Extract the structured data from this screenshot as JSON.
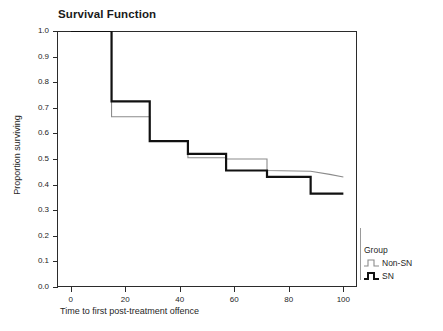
{
  "chart_data": {
    "type": "line",
    "title": "Survival Function",
    "xlabel": "Time to first post-treatment offence",
    "ylabel": "Proportion surviving",
    "xlim": [
      -5,
      105
    ],
    "ylim": [
      0.0,
      1.0
    ],
    "grid": false,
    "legend_position": "right",
    "legend_title": "Group",
    "xticks": [
      0,
      20,
      40,
      60,
      80,
      100
    ],
    "xtick_labels": [
      "0",
      "20",
      "40",
      "60",
      "80",
      "100"
    ],
    "yticks": [
      0.0,
      0.1,
      0.2,
      0.3,
      0.4,
      0.5,
      0.6,
      0.7,
      0.8,
      0.9,
      1.0
    ],
    "ytick_labels": [
      "0.0",
      "0.1",
      "0.2",
      "0.3",
      "0.4",
      "0.5",
      "0.6",
      "0.7",
      "0.8",
      "0.9",
      "1.0"
    ],
    "series": [
      {
        "name": "Non-SN",
        "color": "#8c8c8c",
        "linewidth": 1,
        "style": "step-post",
        "x": [
          0,
          15,
          15,
          29,
          29,
          43,
          43,
          57,
          57,
          72,
          72,
          88,
          95,
          100
        ],
        "y": [
          1.0,
          1.0,
          0.665,
          0.665,
          0.57,
          0.57,
          0.505,
          0.505,
          0.5,
          0.5,
          0.455,
          0.452,
          0.44,
          0.43
        ]
      },
      {
        "name": "SN",
        "color": "#111111",
        "linewidth": 2,
        "style": "step-post",
        "x": [
          0,
          15,
          15,
          29,
          29,
          43,
          43,
          57,
          57,
          72,
          72,
          88,
          88,
          100
        ],
        "y": [
          1.0,
          1.0,
          0.725,
          0.725,
          0.57,
          0.57,
          0.52,
          0.52,
          0.455,
          0.455,
          0.43,
          0.43,
          0.365,
          0.365
        ]
      }
    ]
  },
  "legend": {
    "title": "Group",
    "entries": [
      {
        "label": "Non-SN",
        "color": "#8c8c8c"
      },
      {
        "label": "SN",
        "color": "#111111"
      }
    ]
  }
}
